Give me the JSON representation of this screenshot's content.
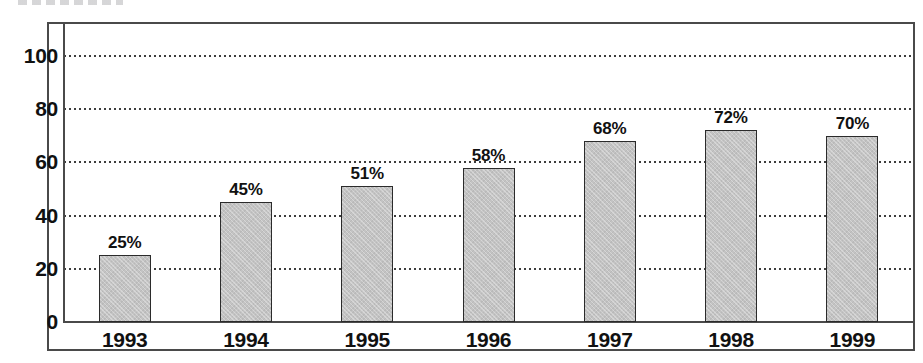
{
  "chart_data": {
    "type": "bar",
    "title": "",
    "xlabel": "",
    "ylabel": "",
    "categories": [
      "1993",
      "1994",
      "1995",
      "1996",
      "1997",
      "1998",
      "1999"
    ],
    "values": [
      25,
      45,
      51,
      58,
      68,
      72,
      70
    ],
    "data_labels": [
      "25%",
      "45%",
      "51%",
      "58%",
      "68%",
      "72%",
      "70%"
    ],
    "ylim": [
      0,
      112
    ],
    "yticks": [
      0,
      20,
      40,
      60,
      80,
      100
    ],
    "ytick_labels": [
      "0",
      "20",
      "40",
      "60",
      "80",
      "100"
    ],
    "grid": "horizontal-dotted",
    "legend": "none",
    "bar_color": "#c3c3c3",
    "bar_edge_color": "#2b2b2b",
    "grid_color": "#3c3c3c",
    "frame_color": "#4a4a4a",
    "background_color": "#ffffff",
    "text_color": "#111111"
  }
}
